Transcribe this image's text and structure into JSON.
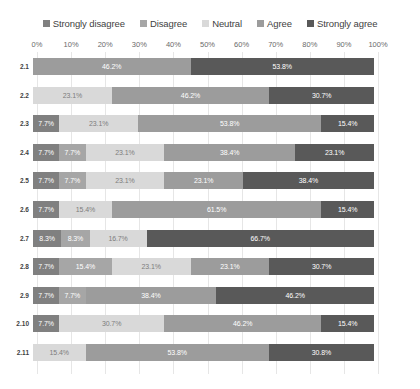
{
  "legend": {
    "items": [
      {
        "label": "Strongly disagree",
        "color": "#808080",
        "swatch_name": "legend-swatch-strongly-disagree"
      },
      {
        "label": "Disagree",
        "color": "#a6a6a6",
        "swatch_name": "legend-swatch-disagree"
      },
      {
        "label": "Neutral",
        "color": "#d9d9d9",
        "swatch_name": "legend-swatch-neutral"
      },
      {
        "label": "Agree",
        "color": "#9c9c9c",
        "swatch_name": "legend-swatch-agree"
      },
      {
        "label": "Strongly agree",
        "color": "#595959",
        "swatch_name": "legend-swatch-strongly-agree"
      }
    ]
  },
  "axis": {
    "ticks": [
      "0%",
      "10%",
      "20%",
      "30%",
      "40%",
      "50%",
      "60%",
      "70%",
      "80%",
      "90%",
      "100%"
    ]
  },
  "chart_data": {
    "type": "bar",
    "title": "",
    "xlabel": "",
    "ylabel": "",
    "xlim": [
      0,
      100
    ],
    "grid": true,
    "stacked": true,
    "orientation": "horizontal",
    "legend_position": "top",
    "categories": [
      "2.1",
      "2.2",
      "2.3",
      "2.4",
      "2.5",
      "2.6",
      "2.7",
      "2.8",
      "2.9",
      "2.10",
      "2.11"
    ],
    "series": [
      {
        "name": "Strongly disagree",
        "color": "#808080",
        "values": [
          0,
          0,
          7.7,
          7.7,
          7.7,
          7.7,
          8.3,
          7.7,
          7.7,
          7.7,
          0
        ]
      },
      {
        "name": "Disagree",
        "color": "#a6a6a6",
        "values": [
          0,
          0,
          0,
          7.7,
          7.7,
          0,
          8.3,
          15.4,
          7.7,
          0,
          0
        ]
      },
      {
        "name": "Neutral",
        "color": "#d9d9d9",
        "values": [
          0,
          23.1,
          23.1,
          23.1,
          23.1,
          15.4,
          16.7,
          23.1,
          0,
          30.7,
          15.4
        ]
      },
      {
        "name": "Agree",
        "color": "#9c9c9c",
        "values": [
          46.2,
          46.2,
          53.8,
          38.4,
          23.1,
          61.5,
          0,
          23.1,
          38.4,
          46.2,
          53.8
        ]
      },
      {
        "name": "Strongly agree",
        "color": "#595959",
        "values": [
          53.8,
          30.7,
          15.4,
          23.1,
          38.4,
          15.4,
          66.7,
          30.7,
          46.2,
          15.4,
          30.8
        ]
      }
    ],
    "rows": [
      {
        "label": "2.1",
        "segments": [
          {
            "series": "Agree",
            "value": 46.2,
            "text": "46.2%",
            "color": "#9c9c9c"
          },
          {
            "series": "Strongly agree",
            "value": 53.8,
            "text": "53.8%",
            "color": "#595959"
          }
        ]
      },
      {
        "label": "2.2",
        "segments": [
          {
            "series": "Neutral",
            "value": 23.1,
            "text": "23.1%",
            "color": "#d9d9d9"
          },
          {
            "series": "Agree",
            "value": 46.2,
            "text": "46.2%",
            "color": "#9c9c9c"
          },
          {
            "series": "Strongly agree",
            "value": 30.7,
            "text": "30.7%",
            "color": "#595959"
          }
        ]
      },
      {
        "label": "2.3",
        "segments": [
          {
            "series": "Strongly disagree",
            "value": 7.7,
            "text": "7.7%",
            "color": "#808080"
          },
          {
            "series": "Neutral",
            "value": 23.1,
            "text": "23.1%",
            "color": "#d9d9d9"
          },
          {
            "series": "Agree",
            "value": 53.8,
            "text": "53.8%",
            "color": "#9c9c9c"
          },
          {
            "series": "Strongly agree",
            "value": 15.4,
            "text": "15.4%",
            "color": "#595959"
          }
        ]
      },
      {
        "label": "2.4",
        "segments": [
          {
            "series": "Strongly disagree",
            "value": 7.7,
            "text": "7.7%",
            "color": "#808080"
          },
          {
            "series": "Disagree",
            "value": 7.7,
            "text": "7.7%",
            "color": "#a6a6a6"
          },
          {
            "series": "Neutral",
            "value": 23.1,
            "text": "23.1%",
            "color": "#d9d9d9"
          },
          {
            "series": "Agree",
            "value": 38.4,
            "text": "38.4%",
            "color": "#9c9c9c"
          },
          {
            "series": "Strongly agree",
            "value": 23.1,
            "text": "23.1%",
            "color": "#595959"
          }
        ]
      },
      {
        "label": "2.5",
        "segments": [
          {
            "series": "Strongly disagree",
            "value": 7.7,
            "text": "7.7%",
            "color": "#808080"
          },
          {
            "series": "Disagree",
            "value": 7.7,
            "text": "7.7%",
            "color": "#a6a6a6"
          },
          {
            "series": "Neutral",
            "value": 23.1,
            "text": "23.1%",
            "color": "#d9d9d9"
          },
          {
            "series": "Agree",
            "value": 23.1,
            "text": "23.1%",
            "color": "#9c9c9c"
          },
          {
            "series": "Strongly agree",
            "value": 38.4,
            "text": "38.4%",
            "color": "#595959"
          }
        ]
      },
      {
        "label": "2.6",
        "segments": [
          {
            "series": "Strongly disagree",
            "value": 7.7,
            "text": "7.7%",
            "color": "#808080"
          },
          {
            "series": "Neutral",
            "value": 15.4,
            "text": "15.4%",
            "color": "#d9d9d9"
          },
          {
            "series": "Agree",
            "value": 61.5,
            "text": "61.5%",
            "color": "#9c9c9c"
          },
          {
            "series": "Strongly agree",
            "value": 15.4,
            "text": "15.4%",
            "color": "#595959"
          }
        ]
      },
      {
        "label": "2.7",
        "segments": [
          {
            "series": "Strongly disagree",
            "value": 8.3,
            "text": "8.3%",
            "color": "#808080"
          },
          {
            "series": "Disagree",
            "value": 8.3,
            "text": "8.3%",
            "color": "#a6a6a6"
          },
          {
            "series": "Neutral",
            "value": 16.7,
            "text": "16.7%",
            "color": "#d9d9d9"
          },
          {
            "series": "Strongly agree",
            "value": 66.7,
            "text": "66.7%",
            "color": "#595959"
          }
        ]
      },
      {
        "label": "2.8",
        "segments": [
          {
            "series": "Strongly disagree",
            "value": 7.7,
            "text": "7.7%",
            "color": "#808080"
          },
          {
            "series": "Disagree",
            "value": 15.4,
            "text": "15.4%",
            "color": "#a6a6a6"
          },
          {
            "series": "Neutral",
            "value": 23.1,
            "text": "23.1%",
            "color": "#d9d9d9"
          },
          {
            "series": "Agree",
            "value": 23.1,
            "text": "23.1%",
            "color": "#9c9c9c"
          },
          {
            "series": "Strongly agree",
            "value": 30.7,
            "text": "30.7%",
            "color": "#595959"
          }
        ]
      },
      {
        "label": "2.9",
        "segments": [
          {
            "series": "Strongly disagree",
            "value": 7.7,
            "text": "7.7%",
            "color": "#808080"
          },
          {
            "series": "Disagree",
            "value": 7.7,
            "text": "7.7%",
            "color": "#a6a6a6"
          },
          {
            "series": "Agree",
            "value": 38.4,
            "text": "38.4%",
            "color": "#9c9c9c"
          },
          {
            "series": "Strongly agree",
            "value": 46.2,
            "text": "46.2%",
            "color": "#595959"
          }
        ]
      },
      {
        "label": "2.10",
        "segments": [
          {
            "series": "Strongly disagree",
            "value": 7.7,
            "text": "7.7%",
            "color": "#808080"
          },
          {
            "series": "Neutral",
            "value": 30.7,
            "text": "30.7%",
            "color": "#d9d9d9"
          },
          {
            "series": "Agree",
            "value": 46.2,
            "text": "46.2%",
            "color": "#9c9c9c"
          },
          {
            "series": "Strongly agree",
            "value": 15.4,
            "text": "15.4%",
            "color": "#595959"
          }
        ]
      },
      {
        "label": "2.11",
        "segments": [
          {
            "series": "Neutral",
            "value": 15.4,
            "text": "15.4%",
            "color": "#d9d9d9"
          },
          {
            "series": "Agree",
            "value": 53.8,
            "text": "53.8%",
            "color": "#9c9c9c"
          },
          {
            "series": "Strongly agree",
            "value": 30.8,
            "text": "30.8%",
            "color": "#595959"
          }
        ]
      }
    ]
  }
}
